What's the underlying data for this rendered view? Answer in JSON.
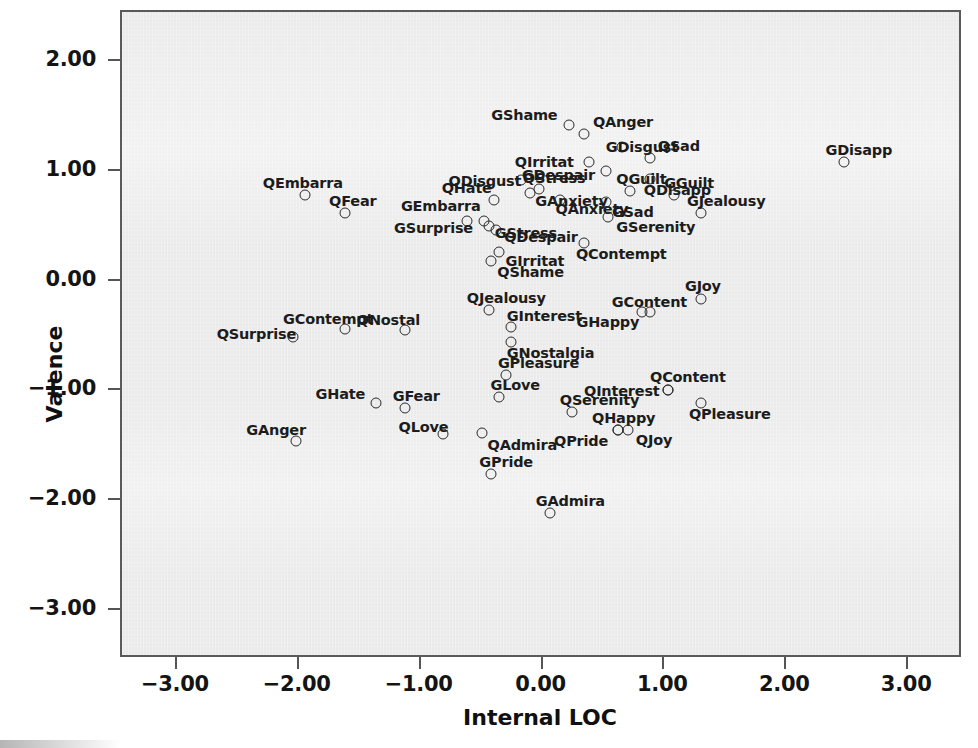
{
  "figure": {
    "background_color": "#ffffff",
    "plot_background_color": "#eaeaea",
    "frame_color": "#5a5a5a",
    "marker_color": "#2b2b2b",
    "label_color": "#1c1c1c"
  },
  "chart_data": {
    "type": "scatter",
    "title": "",
    "xlabel": "Internal LOC",
    "ylabel": "Valence",
    "xlim": [
      -3.45,
      3.45
    ],
    "ylim": [
      -3.45,
      2.45
    ],
    "xticks": [
      "-3.00",
      "-2.00",
      "-1.00",
      "0.00",
      "1.00",
      "2.00",
      "3.00"
    ],
    "xtick_values": [
      -3,
      -2,
      -1,
      0,
      1,
      2,
      3
    ],
    "yticks": [
      "2.00",
      "1.00",
      "0.00",
      "-1.00",
      "-2.00",
      "-3.00"
    ],
    "ytick_values": [
      2,
      1,
      0,
      -1,
      -2,
      -3
    ],
    "grid": false,
    "legend": "none",
    "marker": "open-circle",
    "points": [
      {
        "label": "GShame",
        "x": 0.22,
        "y": 1.42,
        "lx": -78,
        "ly": -17
      },
      {
        "label": "QAnger",
        "x": 0.34,
        "y": 1.34,
        "lx": 9,
        "ly": -19
      },
      {
        "label": "GDisapp",
        "x": 2.47,
        "y": 1.08,
        "lx": -18,
        "ly": -19
      },
      {
        "label": "QIrritat",
        "x": 0.38,
        "y": 1.08,
        "lx": -74,
        "ly": -7
      },
      {
        "label": "GDisgust",
        "x": 0.65,
        "y": 1.22,
        "lx": -16,
        "ly": -7
      },
      {
        "label": "QSad",
        "x": 0.88,
        "y": 1.12,
        "lx": 8,
        "ly": -19
      },
      {
        "label": "QDisgust",
        "x": -0.18,
        "y": 0.92,
        "lx": -72,
        "ly": -6
      },
      {
        "label": "QStress",
        "x": -0.03,
        "y": 0.84,
        "lx": -16,
        "ly": -18
      },
      {
        "label": "GDespair",
        "x": 0.52,
        "y": 1.0,
        "lx": -84,
        "ly": -3
      },
      {
        "label": "QGuilt",
        "x": 0.72,
        "y": 0.82,
        "lx": -14,
        "ly": -19
      },
      {
        "label": "QDisapp",
        "x": 0.88,
        "y": 0.93,
        "lx": -6,
        "ly": 4
      },
      {
        "label": "GGuilt",
        "x": 1.08,
        "y": 0.78,
        "lx": -10,
        "ly": -19
      },
      {
        "label": "QEmbarra",
        "x": -1.95,
        "y": 0.78,
        "lx": -42,
        "ly": -19
      },
      {
        "label": "QHate",
        "x": -0.4,
        "y": 0.74,
        "lx": -52,
        "ly": -19
      },
      {
        "label": "GAnxiety",
        "x": -0.1,
        "y": 0.8,
        "lx": 5,
        "ly": 1
      },
      {
        "label": "QAnxiety",
        "x": 0.14,
        "y": 0.74,
        "lx": -4,
        "ly": 2
      },
      {
        "label": "GSad",
        "x": 0.52,
        "y": 0.72,
        "lx": 6,
        "ly": 3
      },
      {
        "label": "GJealousy",
        "x": 1.3,
        "y": 0.62,
        "lx": -14,
        "ly": -19
      },
      {
        "label": "QFear",
        "x": -1.62,
        "y": 0.62,
        "lx": -16,
        "ly": -19
      },
      {
        "label": "GEmbarra",
        "x": -0.62,
        "y": 0.54,
        "lx": -66,
        "ly": -22
      },
      {
        "label": "GStress",
        "x": -0.44,
        "y": 0.5,
        "lx": 6,
        "ly": 0
      },
      {
        "label": "GSerenity",
        "x": 0.54,
        "y": 0.58,
        "lx": 8,
        "ly": 3
      },
      {
        "label": "GSurprise",
        "x": -0.48,
        "y": 0.54,
        "lx": -90,
        "ly": 0
      },
      {
        "label": "QDespair",
        "x": -0.38,
        "y": 0.46,
        "lx": 8,
        "ly": 0
      },
      {
        "label": "GIrritat",
        "x": -0.36,
        "y": 0.26,
        "lx": 7,
        "ly": 2
      },
      {
        "label": "QContempt",
        "x": 0.34,
        "y": 0.34,
        "lx": -8,
        "ly": 4
      },
      {
        "label": "QShame",
        "x": -0.42,
        "y": 0.18,
        "lx": 6,
        "ly": 4
      },
      {
        "label": "GJoy",
        "x": 1.3,
        "y": -0.17,
        "lx": -16,
        "ly": -20
      },
      {
        "label": "GContent",
        "x": 0.88,
        "y": -0.29,
        "lx": -38,
        "ly": -17
      },
      {
        "label": "GHappy",
        "x": 0.82,
        "y": -0.29,
        "lx": -66,
        "ly": 3
      },
      {
        "label": "QJealousy",
        "x": -0.44,
        "y": -0.27,
        "lx": -22,
        "ly": -19
      },
      {
        "label": "QSurprise",
        "x": -2.05,
        "y": -0.51,
        "lx": -76,
        "ly": -10
      },
      {
        "label": "GContempt",
        "x": -1.62,
        "y": -0.44,
        "lx": -62,
        "ly": -17
      },
      {
        "label": "QNostal",
        "x": -1.13,
        "y": -0.45,
        "lx": -48,
        "ly": -17
      },
      {
        "label": "GInterest",
        "x": -0.26,
        "y": -0.42,
        "lx": -4,
        "ly": -18
      },
      {
        "label": "GNostalgia",
        "x": -0.26,
        "y": -0.56,
        "lx": -4,
        "ly": 4
      },
      {
        "label": "GPleasure",
        "x": -0.3,
        "y": -0.86,
        "lx": -8,
        "ly": -19
      },
      {
        "label": "QContent",
        "x": 1.03,
        "y": -1.0,
        "lx": -18,
        "ly": -20
      },
      {
        "label": "QInterest",
        "x": 1.03,
        "y": -1.0,
        "lx": -84,
        "ly": -6
      },
      {
        "label": "GLove",
        "x": -0.36,
        "y": -1.06,
        "lx": -8,
        "ly": -19
      },
      {
        "label": "GHate",
        "x": -1.37,
        "y": -1.12,
        "lx": -60,
        "ly": -16
      },
      {
        "label": "GFear",
        "x": -1.13,
        "y": -1.16,
        "lx": -12,
        "ly": -19
      },
      {
        "label": "QPleasure",
        "x": 1.3,
        "y": -1.12,
        "lx": -12,
        "ly": 4
      },
      {
        "label": "QSerenity",
        "x": 0.24,
        "y": -1.2,
        "lx": -12,
        "ly": -19
      },
      {
        "label": "QHappy",
        "x": 0.62,
        "y": -1.36,
        "lx": -26,
        "ly": -19
      },
      {
        "label": "QJoy",
        "x": 0.7,
        "y": -1.36,
        "lx": 8,
        "ly": 3
      },
      {
        "label": "QPride",
        "x": 0.62,
        "y": -1.36,
        "lx": -64,
        "ly": 4
      },
      {
        "label": "GAnger",
        "x": -2.02,
        "y": -1.46,
        "lx": -50,
        "ly": -18
      },
      {
        "label": "QLove",
        "x": -0.82,
        "y": -1.4,
        "lx": -44,
        "ly": -14
      },
      {
        "label": "QAdmira",
        "x": -0.5,
        "y": -1.39,
        "lx": 6,
        "ly": 5
      },
      {
        "label": "GPride",
        "x": -0.42,
        "y": -1.76,
        "lx": -12,
        "ly": -19
      },
      {
        "label": "GAdmira",
        "x": 0.06,
        "y": -2.12,
        "lx": -14,
        "ly": -19
      }
    ]
  }
}
